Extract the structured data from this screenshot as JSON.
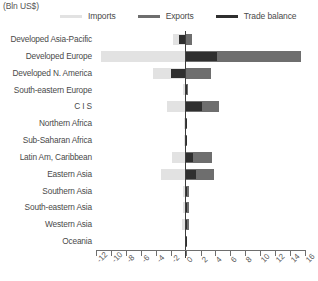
{
  "caption": "(Bln US$)",
  "legend": {
    "position": "top",
    "items": [
      {
        "label": "Imports",
        "color": "#e2e2e2",
        "name": "imports"
      },
      {
        "label": "Exports",
        "color": "#6e6e6e",
        "name": "exports"
      },
      {
        "label": "Trade balance",
        "color": "#2f2f2f",
        "name": "trade-balance"
      }
    ]
  },
  "colors": {
    "imports": "#e2e2e2",
    "exports": "#6e6e6e",
    "balance": "#2f2f2f",
    "axis": "#6e6e6e",
    "zero_line": "#3d3d3d",
    "text": "#4a4a4a"
  },
  "chart_data": {
    "type": "bar",
    "orientation": "horizontal",
    "title": "",
    "subtitle": "",
    "xlabel": "",
    "ylabel": "",
    "units": "(Bln US$)",
    "xlim": [
      -12,
      16
    ],
    "xticks": [
      -12,
      -10,
      -8,
      -6,
      -4,
      -2,
      0,
      2,
      4,
      6,
      8,
      10,
      12,
      14,
      16
    ],
    "xtick_labels": [
      "-12",
      "-10",
      "-8",
      "-6",
      "-4",
      "-2",
      "0",
      "2",
      "4",
      "6",
      "8",
      "10",
      "12",
      "14",
      "16"
    ],
    "grid": false,
    "legend_position": "top",
    "categories": [
      "Developed Asia-Pacific",
      "Developed Europe",
      "Developed N. America",
      "South-eastern Europe",
      "C I S",
      "Northern Africa",
      "Sub-Saharan Africa",
      "Latin Am, Caribbean",
      "Eastern Asia",
      "Southern Asia",
      "South-eastern Asia",
      "Western Asia",
      "Oceania"
    ],
    "series": [
      {
        "name": "Imports",
        "color": "#e2e2e2",
        "values": [
          -1.7,
          -11.3,
          -4.3,
          -0.3,
          -2.5,
          -0.2,
          -0.2,
          -1.8,
          -3.3,
          -0.4,
          -0.4,
          -0.5,
          -0.05
        ]
      },
      {
        "name": "Exports",
        "color": "#6e6e6e",
        "values": [
          0.8,
          15.5,
          3.4,
          0.3,
          4.5,
          0.2,
          0.2,
          3.5,
          3.8,
          0.4,
          0.4,
          0.5,
          0.05
        ]
      },
      {
        "name": "Trade balance",
        "color": "#2f2f2f",
        "values": [
          -0.9,
          4.2,
          -2.0,
          0.1,
          2.2,
          0.05,
          0.05,
          1.0,
          1.4,
          0.15,
          0.15,
          0.2,
          0.02
        ]
      }
    ]
  }
}
